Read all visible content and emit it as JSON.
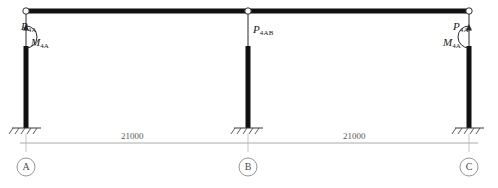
{
  "diagram": {
    "type": "structural-frame-load-diagram",
    "beam": {
      "name": "top-beam",
      "color": "#111111"
    },
    "columns": [
      {
        "id": "A",
        "name": "column-a",
        "color": "#111111"
      },
      {
        "id": "B",
        "name": "column-b",
        "color": "#111111"
      },
      {
        "id": "C",
        "name": "column-c",
        "color": "#111111"
      }
    ],
    "loads": [
      {
        "id": "load-a-force",
        "symbol": "P",
        "subscript": "4A",
        "kind": "point-force"
      },
      {
        "id": "load-a-moment",
        "symbol": "M",
        "subscript": "4A",
        "kind": "moment"
      },
      {
        "id": "load-b-force",
        "symbol": "P",
        "subscript": "4AB",
        "kind": "point-force"
      },
      {
        "id": "load-c-force",
        "symbol": "P",
        "subscript": "4A",
        "kind": "point-force"
      },
      {
        "id": "load-c-moment",
        "symbol": "M",
        "subscript": "4A",
        "kind": "moment"
      }
    ],
    "supports": [
      {
        "id": "support-a",
        "label": "A",
        "kind": "fixed"
      },
      {
        "id": "support-b",
        "label": "B",
        "kind": "fixed"
      },
      {
        "id": "support-c",
        "label": "C",
        "kind": "fixed"
      }
    ],
    "dimensions": [
      {
        "id": "span-ab",
        "value": "21000",
        "from": "A",
        "to": "B"
      },
      {
        "id": "span-bc",
        "value": "21000",
        "from": "B",
        "to": "C"
      }
    ],
    "colors": {
      "member": "#111111",
      "dimension_line": "#999999",
      "annotation": "#1a1a1a",
      "support_hatch": "#4a4a4a",
      "node_circle": "#4a4a4a"
    }
  }
}
